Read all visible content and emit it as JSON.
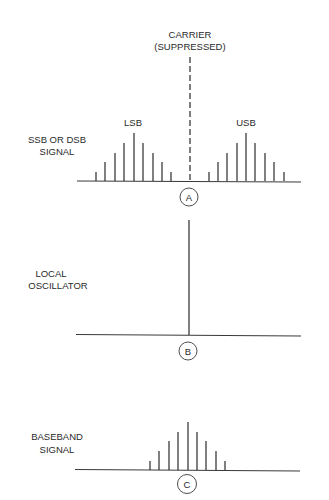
{
  "diagram": {
    "colors": {
      "ink": "#2a2a2a",
      "background": "#ffffff"
    },
    "panel_a": {
      "marker": "A",
      "side_label": [
        "SSB OR DSB",
        "SIGNAL"
      ],
      "carrier_label": [
        "CARRIER",
        "(SUPPRESSED)"
      ],
      "lsb_label": "LSB",
      "usb_label": "USB",
      "baseline": {
        "x1": 77,
        "x2": 301,
        "y": 181
      },
      "carrier": {
        "x": 190,
        "y_top": 57
      },
      "lsb_lines": [
        {
          "x": 96,
          "top": 172
        },
        {
          "x": 105,
          "top": 162
        },
        {
          "x": 115,
          "top": 153
        },
        {
          "x": 124,
          "top": 143
        },
        {
          "x": 134,
          "top": 133
        },
        {
          "x": 143,
          "top": 143
        },
        {
          "x": 153,
          "top": 153
        },
        {
          "x": 162,
          "top": 162
        },
        {
          "x": 171,
          "top": 172
        }
      ],
      "usb_lines": [
        {
          "x": 209,
          "top": 172
        },
        {
          "x": 218,
          "top": 162
        },
        {
          "x": 227,
          "top": 153
        },
        {
          "x": 237,
          "top": 143
        },
        {
          "x": 246,
          "top": 133
        },
        {
          "x": 255,
          "top": 143
        },
        {
          "x": 265,
          "top": 153
        },
        {
          "x": 274,
          "top": 162
        },
        {
          "x": 284,
          "top": 172
        }
      ]
    },
    "panel_b": {
      "marker": "B",
      "side_label": [
        "LOCAL",
        "OSCILLATOR"
      ],
      "baseline": {
        "x1": 76,
        "x2": 301,
        "y": 335
      },
      "oscillator_line": {
        "x": 189,
        "top": 220
      }
    },
    "panel_c": {
      "marker": "C",
      "side_label": [
        "BASEBAND",
        "SIGNAL"
      ],
      "baseline": {
        "x1": 75,
        "x2": 300,
        "y": 470
      },
      "lines": [
        {
          "x": 150,
          "top": 461
        },
        {
          "x": 159,
          "top": 451
        },
        {
          "x": 169,
          "top": 441
        },
        {
          "x": 178,
          "top": 432
        },
        {
          "x": 188,
          "top": 422
        },
        {
          "x": 197,
          "top": 432
        },
        {
          "x": 206,
          "top": 441
        },
        {
          "x": 216,
          "top": 451
        },
        {
          "x": 225,
          "top": 461
        }
      ]
    }
  }
}
